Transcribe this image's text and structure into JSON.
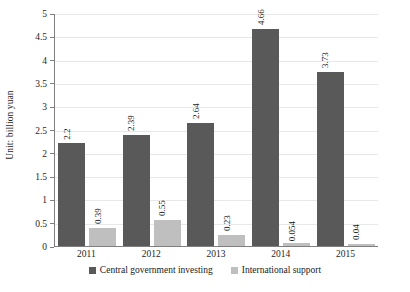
{
  "chart_data": {
    "type": "bar",
    "title": "",
    "subtitle": "",
    "xlabel": "",
    "ylabel": "Unit: billion yuan",
    "categories": [
      "2011",
      "2012",
      "2013",
      "2014",
      "2015"
    ],
    "series": [
      {
        "name": "Central government investing",
        "color": "#595959",
        "values": [
          2.2,
          2.39,
          2.64,
          4.66,
          3.73
        ],
        "value_labels": [
          "2.2",
          "2.39",
          "2.64",
          "4.66",
          "3.73"
        ]
      },
      {
        "name": "International support",
        "color": "#bfbfbf",
        "values": [
          0.39,
          0.55,
          0.23,
          0.054,
          0.04
        ],
        "value_labels": [
          "0.39",
          "0.55",
          "0.23",
          "0.054",
          "0.04"
        ]
      }
    ],
    "ylim": [
      0,
      5
    ],
    "y_ticks": [
      "0",
      "0.5",
      "1",
      "1.5",
      "2",
      "2.5",
      "3",
      "3.5",
      "4",
      "4.5",
      "5"
    ],
    "y_tick_values": [
      0,
      0.5,
      1,
      1.5,
      2,
      2.5,
      3,
      3.5,
      4,
      4.5,
      5
    ],
    "grid": true,
    "legend_position": "bottom",
    "data_labels": true,
    "data_label_rotation": -90
  }
}
